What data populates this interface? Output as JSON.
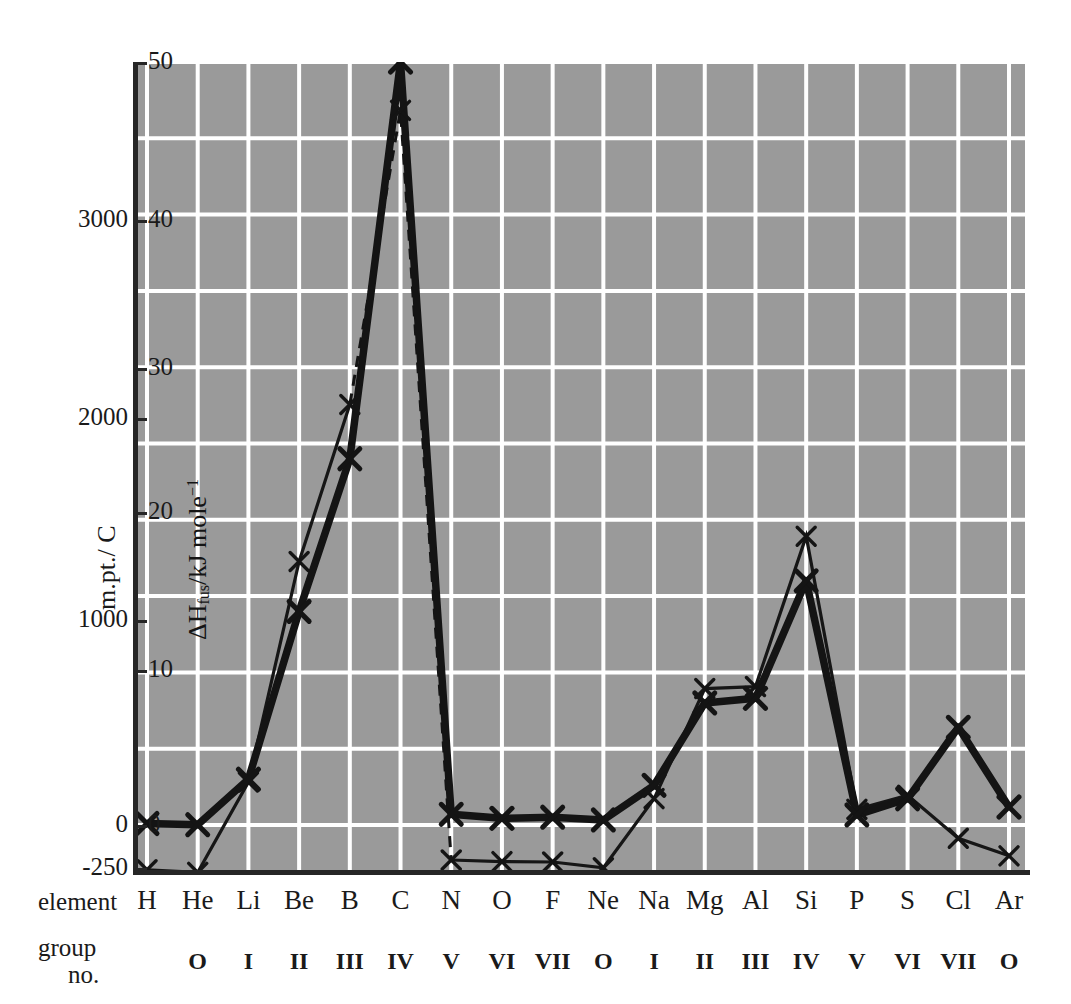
{
  "chart_data": {
    "type": "line",
    "title": "",
    "categories": [
      "H",
      "He",
      "Li",
      "Be",
      "B",
      "C",
      "N",
      "O",
      "F",
      "Ne",
      "Na",
      "Mg",
      "Al",
      "Si",
      "P",
      "S",
      "Cl",
      "Ar"
    ],
    "group_numbers": [
      "",
      "O",
      "I",
      "II",
      "III",
      "IV",
      "V",
      "VI",
      "VII",
      "O",
      "I",
      "II",
      "III",
      "IV",
      "V",
      "VI",
      "VII",
      "O"
    ],
    "xlabel_rows": {
      "element": "element",
      "group": "group",
      "group_no": "no."
    },
    "grid": true,
    "legend": "none",
    "axes": [
      {
        "id": "melting_point",
        "name": "m.pt.",
        "label": "m.pt./ C",
        "unit": "C",
        "position": "outer-left",
        "ylim": [
          -250,
          3700
        ],
        "ticks": [
          -250,
          0,
          1000,
          2000,
          3000
        ],
        "ticklabels": [
          "-250",
          "0",
          "1000",
          "2000",
          "3000"
        ]
      },
      {
        "id": "enthalpy_fusion",
        "name": "dHfus",
        "label": "ΔHfus/kJ mole-1",
        "unit": "kJ mole-1",
        "position": "inner-left",
        "ylim": [
          0,
          54
        ],
        "ticks": [
          0,
          10,
          20,
          30,
          40,
          50
        ],
        "ticklabels": [
          "0",
          "10",
          "20",
          "30",
          "40",
          "50"
        ]
      }
    ],
    "series": [
      {
        "name": "m.pt.",
        "axis": "melting_point",
        "style": "thin-solid-with-dashed-peak",
        "marker": "x",
        "values": [
          -259,
          -272,
          181,
          1287,
          2075,
          3550,
          -210,
          -218,
          -220,
          -249,
          98,
          650,
          660,
          1414,
          44,
          115,
          -101,
          -189
        ]
      },
      {
        "name": "dHfus",
        "axis": "enthalpy_fusion",
        "style": "thick-solid",
        "marker": "x",
        "values": [
          0.1,
          0.02,
          3.0,
          7.9,
          50.2,
          105.0,
          0.7,
          0.44,
          0.51,
          0.33,
          2.6,
          8.5,
          10.7,
          50.2,
          0.66,
          1.72,
          6.4,
          1.18
        ]
      }
    ],
    "colors": {
      "plot_background": "#9a9a9a",
      "gridline": "#ffffff",
      "axis": "#262626",
      "series_line": "#1a1a1a",
      "text": "#1a1a1a"
    }
  },
  "mp_ticks": [
    {
      "label": "3000",
      "y": 220
    },
    {
      "label": "2000",
      "y": 418
    },
    {
      "label": "1000",
      "y": 620
    },
    {
      "label": "0",
      "y": 825
    },
    {
      "label": "-250",
      "y": 868
    }
  ],
  "dh_ticks": [
    {
      "label": "50",
      "y": 62
    },
    {
      "label": "40",
      "y": 220
    },
    {
      "label": "30",
      "y": 368
    },
    {
      "label": "20",
      "y": 512
    },
    {
      "label": "10",
      "y": 670
    },
    {
      "label": "0",
      "y": 825
    }
  ],
  "mp_axis_title": "m.pt./ C",
  "dh_axis_title": {
    "delta_h": "ΔH",
    "sub": "fus",
    "mid": "/kJ mole",
    "sup": "−1"
  }
}
